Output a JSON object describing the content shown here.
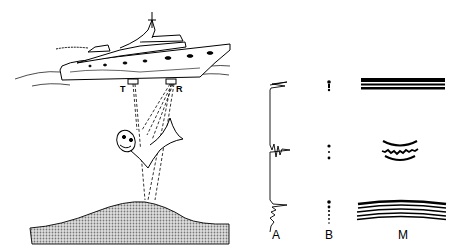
{
  "figure": {
    "labels": {
      "transmitter": "T",
      "receiver": "R",
      "panel_a": "A",
      "panel_b": "B",
      "panel_m": "M"
    },
    "panels": [
      {
        "id": "A",
        "type": "oscilloscope trace",
        "echoes": [
          "transmission pulse",
          "fish echo",
          "bottom echo"
        ]
      },
      {
        "id": "B",
        "type": "dot display",
        "echoes": [
          "transmission pulse",
          "fish echo",
          "bottom echo"
        ]
      },
      {
        "id": "M",
        "type": "paper recorder",
        "echoes": [
          "transmission lines",
          "fish arc",
          "bottom arcs"
        ]
      }
    ],
    "colors": {
      "ink": "#000000",
      "background": "#ffffff",
      "seabed": "#b8b8b8"
    }
  }
}
